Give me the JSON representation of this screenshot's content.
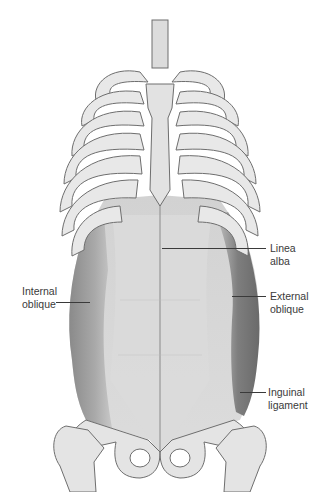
{
  "figure": {
    "colors": {
      "background": "#ffffff",
      "bone": "#e6e6e6",
      "bone_outline": "#707070",
      "muscle_light": "#d4d4d4",
      "muscle_dark": "#7a7a7a",
      "label_text": "#3a3a3a"
    }
  },
  "labels": [
    {
      "id": "linea-alba",
      "text": "Linea\nalba"
    },
    {
      "id": "internal-oblique",
      "text": "Internal\noblique"
    },
    {
      "id": "external-oblique",
      "text": "External\noblique"
    },
    {
      "id": "inguinal-ligament",
      "text": "Inguinal\nligament"
    }
  ]
}
